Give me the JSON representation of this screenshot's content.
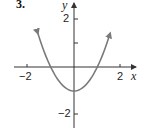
{
  "problem_number": "3.",
  "chart_data": {
    "type": "line",
    "title": "",
    "function": "y = x^2 - 1",
    "xlabel": "x",
    "ylabel": "y",
    "xlim": [
      -2.5,
      2.5
    ],
    "ylim": [
      -2.3,
      2.7
    ],
    "x_ticks": [
      -2,
      2
    ],
    "x_tick_labels": [
      "-2",
      "2"
    ],
    "y_ticks": [
      2,
      1,
      -2
    ],
    "y_tick_labels": [
      "2",
      "",
      "-2"
    ],
    "grid": false,
    "series": [
      {
        "name": "parabola",
        "color": "#7a7a7a",
        "x": [
          -1.55,
          -1.0,
          -0.5,
          0,
          0.5,
          1.0,
          1.55
        ],
        "y": [
          1.4,
          0,
          -0.75,
          -1,
          -0.75,
          0,
          1.4
        ],
        "arrows_at_ends": true
      }
    ],
    "key_points": {
      "vertex": [
        0,
        -1
      ],
      "x_intercepts": [
        [
          -1,
          0
        ],
        [
          1,
          0
        ]
      ]
    }
  },
  "labels": {
    "x_axis": "x",
    "y_axis": "y",
    "x_tick_neg2": "−2",
    "x_tick_2": "2",
    "y_tick_2": "2",
    "y_tick_neg2": "−2"
  }
}
